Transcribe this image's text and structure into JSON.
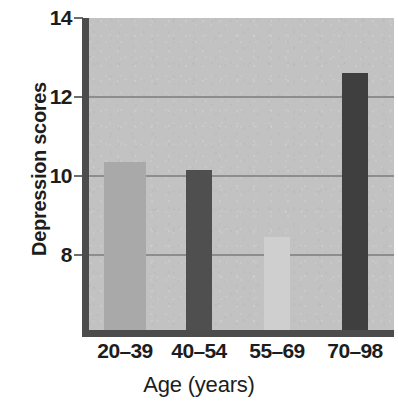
{
  "chart_data": {
    "type": "bar",
    "title": "",
    "xlabel": "Age (years)",
    "ylabel": "Depression scores",
    "categories": [
      "20–39",
      "40–54",
      "55–69",
      "70–98"
    ],
    "values": [
      10.35,
      10.15,
      8.45,
      12.6
    ],
    "ylim": [
      6.0,
      14.0
    ],
    "yticks": [
      8,
      10,
      12,
      14
    ],
    "ytick_labels": [
      "8",
      "10",
      "12",
      "14"
    ],
    "gridlines": [
      8,
      10,
      12
    ],
    "grid": true,
    "legend": null,
    "bar_colors": [
      "#a9a9a9",
      "#4f4f4f",
      "#cfcfcf",
      "#3f3f3f"
    ],
    "plot_background": "#c2c2c2",
    "axis_color": "#4c4c4c",
    "gridline_color": "#8d8d8d",
    "text_color": "#1d1d1d"
  },
  "axes": {
    "y_title": "Depression scores",
    "x_title": "Age (years)",
    "y_tick_0": "8",
    "y_tick_1": "10",
    "y_tick_2": "12",
    "y_tick_3": "14",
    "x_tick_0": "20–39",
    "x_tick_1": "40–54",
    "x_tick_2": "55–69",
    "x_tick_3": "70–98"
  }
}
